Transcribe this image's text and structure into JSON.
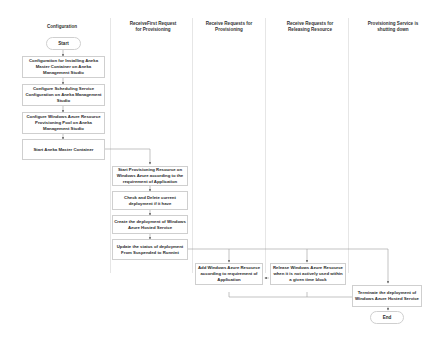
{
  "diagram": {
    "type": "swimlane-flowchart",
    "lanes": [
      {
        "id": "config",
        "title": "Configuration"
      },
      {
        "id": "first",
        "title": "ReceiveFirst Request\nfor Provisioning"
      },
      {
        "id": "recv",
        "title": "Receive Requests for\nProvisioning"
      },
      {
        "id": "release",
        "title": "Receive Requests for\nReleasing Resource"
      },
      {
        "id": "shutdown",
        "title": "Provisioning Service is\nshutting down"
      }
    ],
    "nodes": {
      "start": "Start",
      "cfg1": "Configuration for Installing Aneka Master Container on Aneka Management Studio",
      "cfg2": "Configure Scheduling Service Configuration on Aneka Management Studio",
      "cfg3": "Configure Windows Azure Resource Provisioning Pool on Aneka Management Studio",
      "cfg4": "Start Aneka Master Container",
      "p1": "Start Provisioning Resource on Windows Azure according to the requirement of Application",
      "p2": "Check and Delete current deployment if it have",
      "p3": "Create the deployment of Windows Azure Hosted Service",
      "p4": "Update the status of deployment From Suspended to Runnint",
      "r1": "Add Windows Azure Resource according to requirement of Application",
      "rel1": "Release Windows Azure Resource when it is not actively used within a given time block",
      "s1": "Terminate the deployment of Windows Azure Hosted Service",
      "end": "End"
    },
    "edges": [
      [
        "start",
        "cfg1"
      ],
      [
        "cfg1",
        "cfg2"
      ],
      [
        "cfg2",
        "cfg3"
      ],
      [
        "cfg3",
        "cfg4"
      ],
      [
        "cfg4",
        "p1"
      ],
      [
        "p1",
        "p2"
      ],
      [
        "p2",
        "p3"
      ],
      [
        "p3",
        "p4"
      ],
      [
        "p4",
        "r1"
      ],
      [
        "p4",
        "rel1"
      ],
      [
        "p4",
        "s1"
      ],
      [
        "rel1",
        "r1"
      ],
      [
        "r1",
        "s1"
      ],
      [
        "rel1",
        "s1"
      ],
      [
        "s1",
        "end"
      ]
    ],
    "colors": {
      "line": "#9a9a9a",
      "border": "#cfcfcf",
      "divider": "#e6e6e6"
    }
  }
}
